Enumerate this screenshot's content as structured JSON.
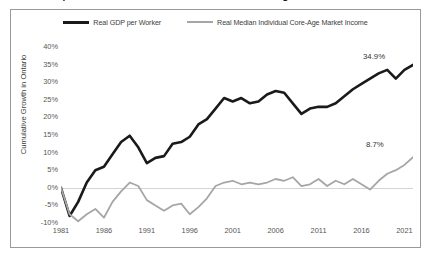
{
  "title": "Real GDP per Worker and Real Median Individual Core-Age Market Income in Ontario",
  "legend": {
    "entries": [
      {
        "label": "Real GDP per Worker",
        "color": "#1a1a1a",
        "key": "gdp"
      },
      {
        "label": "Real Median Individual Core-Age Market Income",
        "color": "#a6a6a6",
        "key": "income"
      }
    ]
  },
  "axes": {
    "y_title": "Cumulative Growth in Ontario",
    "y_ticks": [
      "40%",
      "35%",
      "30%",
      "25%",
      "20%",
      "15%",
      "10%",
      "5%",
      "0%",
      "-5%",
      "-10%"
    ],
    "x_ticks": [
      "1981",
      "1986",
      "1991",
      "1996",
      "2001",
      "2006",
      "2011",
      "2016",
      "2021"
    ]
  },
  "end_labels": {
    "gdp": "34.9%",
    "income": "8.7%"
  },
  "chart_data": {
    "type": "line",
    "title": "Real GDP per Worker and Real Median Individual Core-Age Market Income in Ontario",
    "xlabel": "",
    "ylabel": "Cumulative Growth in Ontario",
    "xlim": [
      1981,
      2022
    ],
    "ylim": [
      -10,
      40
    ],
    "ytick_step": 5,
    "grid": "zero-line-only",
    "legend_position": "top-center",
    "x": [
      1981,
      1982,
      1983,
      1984,
      1985,
      1986,
      1987,
      1988,
      1989,
      1990,
      1991,
      1992,
      1993,
      1994,
      1995,
      1996,
      1997,
      1998,
      1999,
      2000,
      2001,
      2002,
      2003,
      2004,
      2005,
      2006,
      2007,
      2008,
      2009,
      2010,
      2011,
      2012,
      2013,
      2014,
      2015,
      2016,
      2017,
      2018,
      2019,
      2020,
      2021,
      2022
    ],
    "series": [
      {
        "name": "Real GDP per Worker",
        "color": "#1a1a1a",
        "end_label": "34.9%",
        "values": [
          0.0,
          -8.0,
          -4.0,
          1.5,
          5.0,
          6.0,
          9.5,
          13.0,
          14.8,
          11.5,
          7.0,
          8.5,
          9.0,
          12.5,
          13.0,
          14.5,
          18.0,
          19.5,
          22.5,
          25.5,
          24.5,
          25.5,
          24.0,
          24.5,
          26.5,
          27.5,
          27.0,
          24.0,
          21.0,
          22.5,
          23.0,
          23.0,
          24.0,
          26.0,
          28.0,
          29.5,
          31.0,
          32.5,
          33.5,
          31.0,
          33.5,
          34.9
        ]
      },
      {
        "name": "Real Median Individual Core-Age Market Income",
        "color": "#a6a6a6",
        "end_label": "8.7%",
        "values": [
          0.0,
          -7.5,
          -9.5,
          -7.5,
          -6.0,
          -8.5,
          -4.0,
          -1.0,
          1.5,
          0.5,
          -3.5,
          -5.0,
          -6.5,
          -5.0,
          -4.5,
          -7.5,
          -5.5,
          -3.0,
          0.5,
          1.5,
          2.0,
          1.0,
          1.5,
          1.0,
          1.5,
          2.5,
          2.0,
          3.0,
          0.5,
          1.0,
          2.5,
          0.5,
          2.0,
          1.0,
          2.5,
          1.0,
          -0.5,
          2.0,
          4.0,
          5.0,
          6.5,
          8.7
        ]
      }
    ]
  }
}
